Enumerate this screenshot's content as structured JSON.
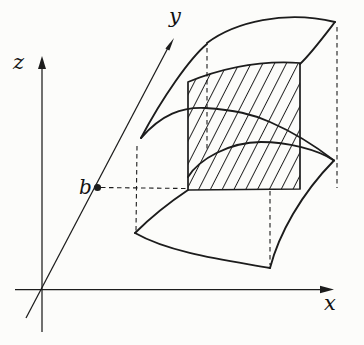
{
  "figure": {
    "kind": "textbook-3d-cross-section-diagram",
    "background_color": "#fcfcfa",
    "ink_color": "#1c1c1c",
    "axes": {
      "x": {
        "label": "x"
      },
      "y": {
        "label": "y"
      },
      "z": {
        "label": "z"
      }
    },
    "point_b": {
      "label": "b"
    },
    "hatch": {
      "angle_deg": -63,
      "spacing_px": 10.5
    }
  }
}
